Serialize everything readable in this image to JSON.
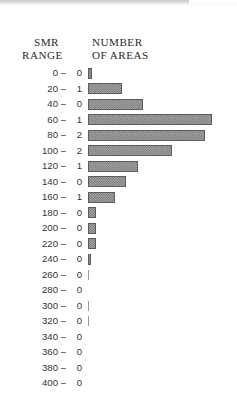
{
  "figure": {
    "headers": {
      "left_line1": "SMR",
      "left_line2": "RANGE",
      "right_line1": "NUMBER",
      "right_line2": "OF AREAS"
    }
  },
  "chart_data": {
    "type": "bar",
    "orientation": "horizontal",
    "title": "",
    "xlabel": "NUMBER OF AREAS",
    "ylabel": "SMR RANGE",
    "grid": false,
    "legend": null,
    "categories": [
      "0 –",
      "20 –",
      "40 –",
      "60 –",
      "80 –",
      "100 –",
      "120 –",
      "140 –",
      "160 –",
      "180 –",
      "200 –",
      "220 –",
      "240 –",
      "260 –",
      "280 –",
      "300 –",
      "320 –",
      "340 –",
      "360 –",
      "380 –",
      "400 –"
    ],
    "count_labels": [
      "0",
      "1",
      "0",
      "1",
      "2",
      "2",
      "1",
      "0",
      "1",
      "0",
      "0",
      "0",
      "0",
      "0",
      "0",
      "0",
      "0",
      "0",
      "0",
      "0",
      "0"
    ],
    "values": [
      4,
      34,
      55,
      124,
      117,
      84,
      50,
      38,
      27,
      8,
      8,
      8,
      3,
      1,
      0,
      1,
      1,
      0,
      0,
      0,
      0
    ],
    "xlim": [
      0,
      149
    ],
    "rows": [
      {
        "range": "0 –",
        "count": "0",
        "bar": 4,
        "tick": false
      },
      {
        "range": "20 –",
        "count": "1",
        "bar": 34,
        "tick": false
      },
      {
        "range": "40 –",
        "count": "0",
        "bar": 55,
        "tick": false
      },
      {
        "range": "60 –",
        "count": "1",
        "bar": 124,
        "tick": false
      },
      {
        "range": "80 –",
        "count": "2",
        "bar": 117,
        "tick": false
      },
      {
        "range": "100 –",
        "count": "2",
        "bar": 84,
        "tick": false
      },
      {
        "range": "120 –",
        "count": "1",
        "bar": 50,
        "tick": false
      },
      {
        "range": "140 –",
        "count": "0",
        "bar": 38,
        "tick": false
      },
      {
        "range": "160 –",
        "count": "1",
        "bar": 27,
        "tick": false
      },
      {
        "range": "180 –",
        "count": "0",
        "bar": 8,
        "tick": false
      },
      {
        "range": "200 –",
        "count": "0",
        "bar": 8,
        "tick": false
      },
      {
        "range": "220 –",
        "count": "0",
        "bar": 8,
        "tick": false
      },
      {
        "range": "240 –",
        "count": "0",
        "bar": 3,
        "tick": false
      },
      {
        "range": "260 –",
        "count": "0",
        "bar": 1,
        "tick": true
      },
      {
        "range": "280 –",
        "count": "0",
        "bar": 0,
        "tick": false
      },
      {
        "range": "300 –",
        "count": "0",
        "bar": 1,
        "tick": true
      },
      {
        "range": "320 –",
        "count": "0",
        "bar": 1,
        "tick": true
      },
      {
        "range": "340 –",
        "count": "0",
        "bar": 0,
        "tick": false
      },
      {
        "range": "360 –",
        "count": "0",
        "bar": 0,
        "tick": false
      },
      {
        "range": "380 –",
        "count": "0",
        "bar": 0,
        "tick": false
      },
      {
        "range": "400 –",
        "count": "0",
        "bar": 0,
        "tick": false
      }
    ]
  }
}
